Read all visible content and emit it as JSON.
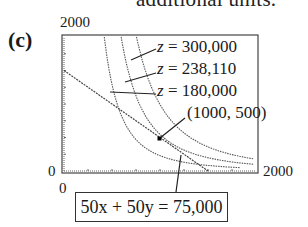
{
  "header": {
    "cut_off_text": "additional units.",
    "part_label": "(c)"
  },
  "chart_data": {
    "type": "line",
    "title": "",
    "xlabel": "",
    "ylabel": "",
    "xlim": [
      0,
      2000
    ],
    "ylim": [
      0,
      2000
    ],
    "x_tick_labels": [
      "0",
      "2000"
    ],
    "y_tick_labels": [
      "0",
      "2000"
    ],
    "grid": false,
    "series": [
      {
        "name": "z = 300,000",
        "kind": "level-curve",
        "points": [
          [
            735,
            2000
          ],
          [
            1000,
            920
          ],
          [
            1500,
            450
          ],
          [
            2000,
            160
          ]
        ]
      },
      {
        "name": "z = 238,110",
        "kind": "level-curve",
        "points": [
          [
            575,
            2000
          ],
          [
            1000,
            500
          ],
          [
            1500,
            250
          ],
          [
            2000,
            90
          ]
        ]
      },
      {
        "name": "z = 180,000",
        "kind": "level-curve",
        "points": [
          [
            367,
            2000
          ],
          [
            700,
            500
          ],
          [
            1000,
            260
          ],
          [
            1500,
            110
          ],
          [
            2000,
            40
          ]
        ]
      },
      {
        "name": "50x + 50y = 75,000",
        "kind": "constraint-line",
        "points": [
          [
            0,
            1500
          ],
          [
            1500,
            0
          ]
        ]
      }
    ],
    "annotations": [
      {
        "text": "z = 300,000"
      },
      {
        "text": "z = 238,110"
      },
      {
        "text": "z = 180,000"
      },
      {
        "text": "(1000, 500)",
        "point": [
          1000,
          500
        ]
      },
      {
        "text": "50x + 50y = 75,000"
      }
    ],
    "highlight_point": [
      1000,
      500
    ]
  },
  "labels": {
    "y_max": "2000",
    "y_min": "0",
    "x_min": "0",
    "x_max": "2000",
    "z_var": "z",
    "z1_value": "= 300,000",
    "z2_value": "= 238,110",
    "z3_value": "= 180,000",
    "point": "(1000, 500)",
    "constraint": "50x + 50y = 75,000"
  }
}
